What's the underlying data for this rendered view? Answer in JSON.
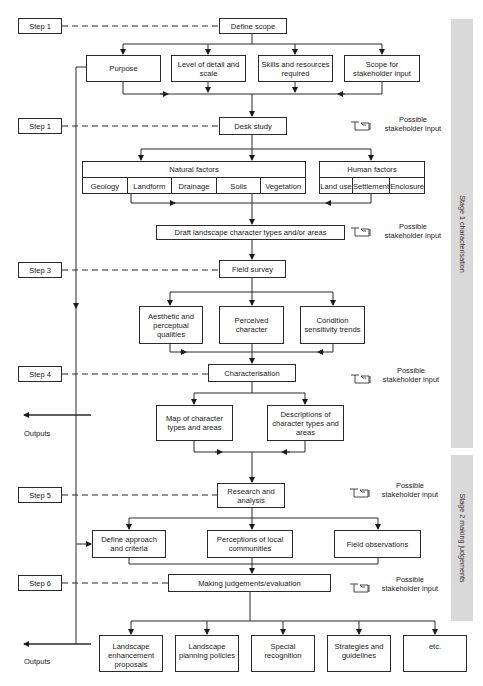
{
  "stages": [
    {
      "label": "Stage 1  characterisation",
      "top": 19,
      "height": 429
    },
    {
      "label": "Stage 2  making judgements",
      "top": 455,
      "height": 166
    }
  ],
  "steps": [
    {
      "label": "Step 1",
      "top": 18
    },
    {
      "label": "Step 1",
      "top": 118
    },
    {
      "label": "Step 3",
      "top": 262
    },
    {
      "label": "Step 4",
      "top": 366
    },
    {
      "label": "Step 5",
      "top": 487
    },
    {
      "label": "Step 6",
      "top": 575
    }
  ],
  "boxes": {
    "define_scope": "Define scope",
    "purpose": "Purpose",
    "level_of_detail": "Level of detail and scale",
    "skills": "Skills and resources required",
    "scope_stakeholder": "Scope for stakeholder input",
    "desk_study": "Desk study",
    "draft": "Draft landscape character types and/or areas",
    "field_survey": "Field survey",
    "aesthetic": "Aesthetic and perceptual qualities",
    "perceived": "Perceived character",
    "condition": "Condition sensitivity trends",
    "characterisation": "Characterisation",
    "map": "Map of character types and areas",
    "descriptions": "Descriptions of character types and areas",
    "research": "Research and analysis",
    "define_approach": "Define approach and criteria",
    "perceptions": "Perceptions of local communities",
    "field_observations": "Field observations",
    "judgements": "Making judgements/evaluation"
  },
  "natural_factors": {
    "title": "Natural factors",
    "items": [
      "Geology",
      "Landform",
      "Drainage",
      "Soils",
      "Vegetation"
    ]
  },
  "human_factors": {
    "title": "Human factors",
    "items": [
      "Land use",
      "Settlement",
      "Enclosure"
    ]
  },
  "outputs": {
    "label": "Outputs",
    "items": [
      "Landscape enhancement proposals",
      "Landscape planning policies",
      "Special recognition",
      "Strategies and guidelines",
      "etc."
    ]
  },
  "stakeholder_note": "Possible stakeholder input",
  "stakeholder_icon": "pointing-hand-icon",
  "colors": {
    "line": "#2a2a2a",
    "band": "#d9d9d9"
  }
}
